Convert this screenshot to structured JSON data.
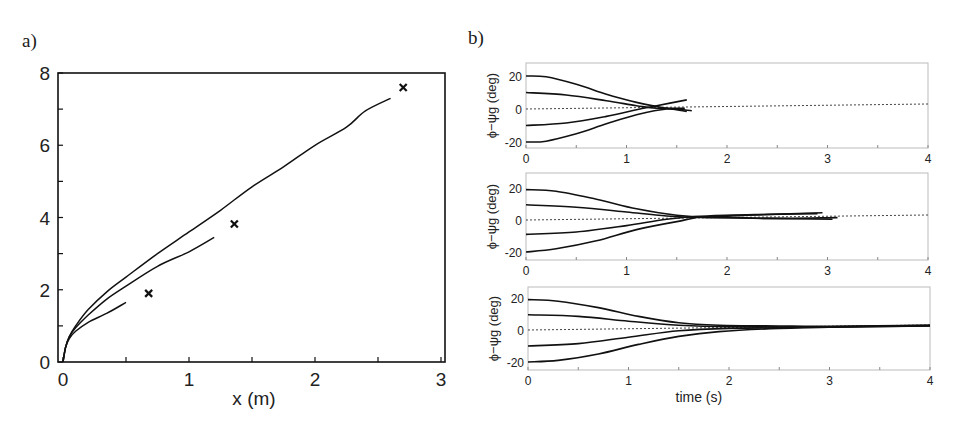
{
  "panels": {
    "a": {
      "label": "a)"
    },
    "b": {
      "label": "b)"
    }
  },
  "chart_data": [
    {
      "panel": "a",
      "type": "line",
      "title": "",
      "xlabel": "x (m)",
      "ylabel": "",
      "xlim": [
        0,
        3
      ],
      "ylim": [
        0,
        8
      ],
      "xticks": [
        "0",
        "1",
        "2",
        "3"
      ],
      "yticks": [
        "0",
        "2",
        "4",
        "6",
        "8"
      ],
      "grid": false,
      "series": [
        {
          "name": "trajectory-1",
          "points": [
            [
              0,
              0
            ],
            [
              0.02,
              0.4
            ],
            [
              0.05,
              0.7
            ],
            [
              0.1,
              1.0
            ],
            [
              0.2,
              1.45
            ],
            [
              0.35,
              1.95
            ],
            [
              0.5,
              2.35
            ],
            [
              0.75,
              3.0
            ],
            [
              1.0,
              3.6
            ],
            [
              1.25,
              4.2
            ],
            [
              1.5,
              4.85
            ],
            [
              1.75,
              5.4
            ],
            [
              2.0,
              6.0
            ],
            [
              2.25,
              6.5
            ],
            [
              2.4,
              6.95
            ],
            [
              2.6,
              7.3
            ]
          ]
        },
        {
          "name": "trajectory-2",
          "points": [
            [
              0,
              0
            ],
            [
              0.02,
              0.4
            ],
            [
              0.05,
              0.7
            ],
            [
              0.1,
              0.95
            ],
            [
              0.2,
              1.3
            ],
            [
              0.35,
              1.75
            ],
            [
              0.5,
              2.1
            ],
            [
              0.75,
              2.65
            ],
            [
              1.0,
              3.05
            ],
            [
              1.2,
              3.45
            ]
          ]
        },
        {
          "name": "trajectory-3",
          "points": [
            [
              0,
              0
            ],
            [
              0.02,
              0.4
            ],
            [
              0.05,
              0.65
            ],
            [
              0.1,
              0.85
            ],
            [
              0.2,
              1.1
            ],
            [
              0.35,
              1.35
            ],
            [
              0.5,
              1.65
            ]
          ]
        }
      ],
      "markers": [
        {
          "symbol": "x",
          "x": 0.68,
          "y": 1.9
        },
        {
          "symbol": "x",
          "x": 1.36,
          "y": 3.82
        },
        {
          "symbol": "x",
          "x": 2.7,
          "y": 7.6
        }
      ]
    },
    {
      "panel": "b-top",
      "type": "line",
      "xlabel": "",
      "ylabel": "ϕ−ψg (deg)",
      "xlim": [
        0,
        4
      ],
      "ylim": [
        -24,
        24
      ],
      "xticks": [
        "0",
        "1",
        "2",
        "3",
        "4"
      ],
      "yticks": [
        "20",
        "0",
        "-20"
      ],
      "reference_line": {
        "y": 0,
        "style": "dotted"
      },
      "series": [
        {
          "name": "init 20",
          "points": [
            [
              0,
              20
            ],
            [
              0.2,
              19.5
            ],
            [
              0.5,
              15
            ],
            [
              0.8,
              9
            ],
            [
              1.1,
              4
            ],
            [
              1.3,
              1.5
            ],
            [
              1.6,
              -1.5
            ]
          ]
        },
        {
          "name": "init 10",
          "points": [
            [
              0,
              10
            ],
            [
              0.4,
              8.5
            ],
            [
              0.8,
              5
            ],
            [
              1.1,
              2
            ],
            [
              1.3,
              0.5
            ],
            [
              1.58,
              0.5
            ]
          ]
        },
        {
          "name": "init -10",
          "points": [
            [
              0,
              -10
            ],
            [
              0.4,
              -8.5
            ],
            [
              0.8,
              -4.5
            ],
            [
              1.1,
              -0.5
            ],
            [
              1.3,
              2
            ],
            [
              1.6,
              5.5
            ]
          ]
        },
        {
          "name": "init -20",
          "points": [
            [
              0,
              -20
            ],
            [
              0.2,
              -19.5
            ],
            [
              0.5,
              -15
            ],
            [
              0.8,
              -9
            ],
            [
              1.1,
              -3.5
            ],
            [
              1.4,
              0
            ],
            [
              1.65,
              -1
            ]
          ]
        }
      ]
    },
    {
      "panel": "b-middle",
      "type": "line",
      "xlabel": "",
      "ylabel": "ϕ−ψg (deg)",
      "xlim": [
        0,
        4
      ],
      "ylim": [
        -24,
        24
      ],
      "xticks": [
        "0",
        "1",
        "2",
        "3",
        "4"
      ],
      "yticks": [
        "20",
        "0",
        "-20"
      ],
      "reference_line": {
        "y": 0,
        "style": "dotted"
      },
      "series": [
        {
          "name": "init 20",
          "points": [
            [
              0,
              19
            ],
            [
              0.3,
              18
            ],
            [
              0.7,
              13
            ],
            [
              1.1,
              7
            ],
            [
              1.5,
              3
            ],
            [
              1.8,
              2
            ],
            [
              2.2,
              3
            ],
            [
              2.95,
              4.5
            ]
          ]
        },
        {
          "name": "init 10",
          "points": [
            [
              0,
              9.5
            ],
            [
              0.5,
              8
            ],
            [
              1.0,
              5
            ],
            [
              1.4,
              2.5
            ],
            [
              1.8,
              1.5
            ],
            [
              2.4,
              1
            ],
            [
              3.05,
              0.5
            ]
          ]
        },
        {
          "name": "init -10",
          "points": [
            [
              0,
              -9
            ],
            [
              0.5,
              -7.5
            ],
            [
              1.0,
              -3.5
            ],
            [
              1.4,
              0.5
            ],
            [
              1.8,
              2.5
            ],
            [
              2.4,
              3.5
            ],
            [
              2.9,
              4
            ]
          ]
        },
        {
          "name": "init -20",
          "points": [
            [
              0,
              -20
            ],
            [
              0.3,
              -18
            ],
            [
              0.7,
              -13
            ],
            [
              1.1,
              -6
            ],
            [
              1.5,
              -1
            ],
            [
              1.8,
              2
            ],
            [
              2.4,
              1
            ],
            [
              3.1,
              1.5
            ]
          ]
        }
      ]
    },
    {
      "panel": "b-bottom",
      "type": "line",
      "xlabel": "time (s)",
      "ylabel": "ϕ−ψg (deg)",
      "xlim": [
        0,
        4
      ],
      "ylim": [
        -24,
        24
      ],
      "xticks": [
        "0",
        "1",
        "2",
        "3",
        "4"
      ],
      "yticks": [
        "20",
        "0",
        "-20"
      ],
      "reference_line": {
        "y": 0,
        "style": "dotted"
      },
      "series": [
        {
          "name": "init 20",
          "points": [
            [
              0,
              19
            ],
            [
              0.3,
              18
            ],
            [
              0.7,
              14
            ],
            [
              1.1,
              8.5
            ],
            [
              1.5,
              4.5
            ],
            [
              1.9,
              3
            ],
            [
              2.5,
              2.5
            ],
            [
              3.0,
              2.3
            ],
            [
              4.0,
              3
            ]
          ]
        },
        {
          "name": "init 10",
          "points": [
            [
              0,
              9.5
            ],
            [
              0.5,
              8.5
            ],
            [
              1.0,
              5.5
            ],
            [
              1.5,
              3
            ],
            [
              2.0,
              2
            ],
            [
              3.0,
              2
            ],
            [
              4.0,
              3
            ]
          ]
        },
        {
          "name": "init -10",
          "points": [
            [
              0,
              -10
            ],
            [
              0.5,
              -8.5
            ],
            [
              1.0,
              -4.5
            ],
            [
              1.5,
              -0.5
            ],
            [
              2.0,
              1
            ],
            [
              3.0,
              1.8
            ],
            [
              4.0,
              2.5
            ]
          ]
        },
        {
          "name": "init -20",
          "points": [
            [
              0,
              -20
            ],
            [
              0.3,
              -19
            ],
            [
              0.7,
              -15
            ],
            [
              1.1,
              -9
            ],
            [
              1.5,
              -4
            ],
            [
              1.9,
              -1
            ],
            [
              2.5,
              1
            ],
            [
              3.0,
              1.8
            ],
            [
              4.0,
              2.5
            ]
          ]
        }
      ]
    }
  ]
}
